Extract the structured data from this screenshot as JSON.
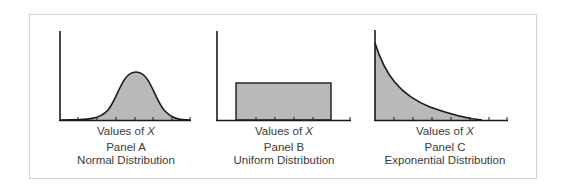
{
  "figure": {
    "panels": [
      {
        "panel_label": "Panel A",
        "title": "Normal Distribution",
        "x_label_prefix": "Values of ",
        "x_label_var": "X"
      },
      {
        "panel_label": "Panel B",
        "title": "Uniform Distribution",
        "x_label_prefix": "Values of ",
        "x_label_var": "X"
      },
      {
        "panel_label": "Panel C",
        "title": "Exponential Distribution",
        "x_label_prefix": "Values of ",
        "x_label_var": "X"
      }
    ],
    "colors": {
      "fill": "#b9b9b9",
      "stroke": "#1a1a1a",
      "frame": "#d4d4d4",
      "text": "#3a3a3a"
    }
  }
}
